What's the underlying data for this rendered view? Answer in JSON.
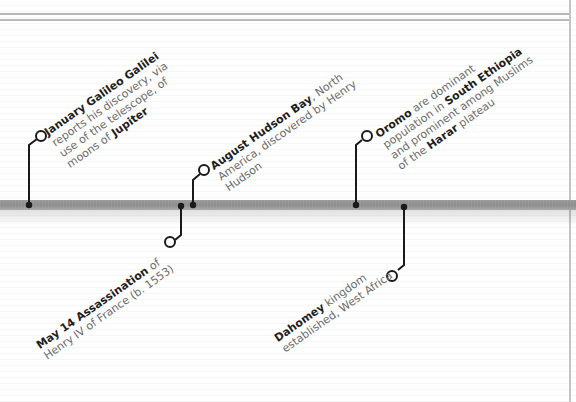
{
  "timeline": {
    "events": [
      {
        "id": "galileo",
        "position": "above",
        "lines": [
          [
            {
              "t": "January ",
              "b": true
            },
            {
              "t": "Galileo Galilei",
              "b": true
            }
          ],
          [
            {
              "t": "reports his discovery, via",
              "b": false
            }
          ],
          [
            {
              "t": "use of the telescope, of",
              "b": false
            }
          ],
          [
            {
              "t": "moons of ",
              "b": false
            },
            {
              "t": "Jupiter",
              "b": true
            }
          ]
        ]
      },
      {
        "id": "henry-iv",
        "position": "below",
        "lines": [
          [
            {
              "t": "May 14 ",
              "b": true
            },
            {
              "t": "Assassination",
              "b": true
            },
            {
              "t": " of",
              "b": false
            }
          ],
          [
            {
              "t": "Henry IV of France (b. 1553)",
              "b": false
            }
          ]
        ]
      },
      {
        "id": "hudson-bay",
        "position": "above",
        "lines": [
          [
            {
              "t": "August ",
              "b": true
            },
            {
              "t": "Hudson Bay",
              "b": true
            },
            {
              "t": ", North",
              "b": false
            }
          ],
          [
            {
              "t": "America, discovered by Henry",
              "b": false
            }
          ],
          [
            {
              "t": "Hudson",
              "b": false
            }
          ]
        ]
      },
      {
        "id": "oromo",
        "position": "above",
        "lines": [
          [
            {
              "t": "Oromo",
              "b": true
            },
            {
              "t": " are dominant",
              "b": false
            }
          ],
          [
            {
              "t": "population in ",
              "b": false
            },
            {
              "t": "South Ethiopia",
              "b": true
            }
          ],
          [
            {
              "t": "and prominent among Muslims",
              "b": false
            }
          ],
          [
            {
              "t": "of the ",
              "b": false
            },
            {
              "t": "Harar",
              "b": true
            },
            {
              "t": " plateau",
              "b": false
            }
          ]
        ]
      },
      {
        "id": "dahomey",
        "position": "below",
        "lines": [
          [
            {
              "t": "Dahomey",
              "b": true
            },
            {
              "t": " kingdom",
              "b": false
            }
          ],
          [
            {
              "t": "established, West Africa",
              "b": false
            }
          ]
        ]
      }
    ]
  },
  "colors": {
    "bold_text": "#1e1e1e",
    "body_text": "#6b6b6b",
    "connector": "#1a1a1a",
    "timeline_bar": "#8c8c8c"
  }
}
